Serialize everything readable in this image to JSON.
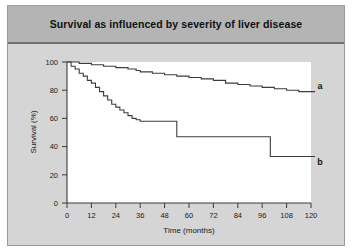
{
  "figure": {
    "title": "Survival as influenced by severity of liver disease",
    "background_color": "#d5d5d5",
    "title_bar_color": "#b4b4b4",
    "plot_background_color": "#ffffff",
    "curve_color": "#3c3c3c"
  },
  "chart_data": {
    "type": "line",
    "title": "Survival as influenced by severity of liver disease",
    "xlabel": "Time (months)",
    "ylabel": "Survival (%)",
    "xlim": [
      0,
      120
    ],
    "ylim": [
      0,
      100
    ],
    "xticks": [
      0,
      12,
      24,
      36,
      48,
      60,
      72,
      84,
      96,
      108,
      120
    ],
    "yticks": [
      0,
      20,
      40,
      60,
      80,
      100
    ],
    "grid": false,
    "legend_position": "right-of-axes-inline-labels",
    "series": [
      {
        "name": "a",
        "label": "a",
        "annotation": "a",
        "step": true,
        "x": [
          0,
          6,
          12,
          18,
          24,
          30,
          34,
          36,
          42,
          48,
          54,
          60,
          66,
          72,
          78,
          84,
          90,
          96,
          102,
          108,
          114,
          120
        ],
        "y": [
          100,
          99,
          98,
          97,
          96,
          95,
          94,
          93,
          92,
          91,
          90,
          89,
          88,
          87,
          85,
          84,
          83,
          82,
          81,
          80,
          79,
          79
        ]
      },
      {
        "name": "b",
        "label": "b",
        "annotation": "b",
        "step": true,
        "x": [
          0,
          2,
          4,
          6,
          8,
          10,
          12,
          14,
          16,
          18,
          20,
          22,
          24,
          26,
          28,
          30,
          32,
          34,
          36,
          42,
          48,
          54,
          60,
          72,
          84,
          96,
          100,
          108,
          120
        ],
        "y": [
          100,
          97,
          95,
          92,
          90,
          87,
          85,
          82,
          79,
          76,
          73,
          70,
          68,
          66,
          64,
          62,
          60,
          59,
          58,
          58,
          58,
          47,
          47,
          47,
          47,
          47,
          33,
          33,
          33
        ]
      }
    ]
  },
  "axes": {
    "x_tick_labels": [
      "0",
      "12",
      "24",
      "36",
      "48",
      "60",
      "72",
      "84",
      "96",
      "108",
      "120"
    ],
    "y_tick_labels": [
      "0",
      "20",
      "40",
      "60",
      "80",
      "100"
    ],
    "x_axis_title": "Time (months)",
    "y_axis_title": "Survival (%)"
  },
  "labels": {
    "curve_a": "a",
    "curve_b": "b"
  }
}
